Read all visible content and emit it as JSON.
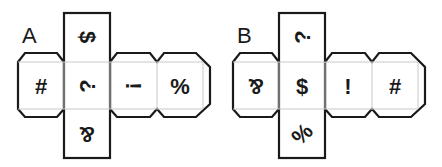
{
  "nets": [
    {
      "label": "A",
      "faces": {
        "top": {
          "symbol": "$",
          "rotation": 90
        },
        "left": {
          "symbol": "#",
          "rotation": 0
        },
        "center": {
          "symbol": "?",
          "rotation": 270
        },
        "right1": {
          "symbol": "!",
          "rotation": 90
        },
        "right2": {
          "symbol": "%",
          "rotation": 0
        },
        "bottom": {
          "symbol": "&",
          "rotation": 180
        }
      }
    },
    {
      "label": "B",
      "faces": {
        "top": {
          "symbol": "?",
          "rotation": 270
        },
        "left": {
          "symbol": "&",
          "rotation": 180
        },
        "center": {
          "symbol": "$",
          "rotation": 0
        },
        "right1": {
          "symbol": "!",
          "rotation": 0
        },
        "right2": {
          "symbol": "#",
          "rotation": 0
        },
        "bottom": {
          "symbol": "%",
          "rotation": 315
        }
      }
    }
  ],
  "colors": {
    "stroke": "#1a1a1a",
    "fold": "#c8c8c8",
    "background": "#ffffff"
  }
}
